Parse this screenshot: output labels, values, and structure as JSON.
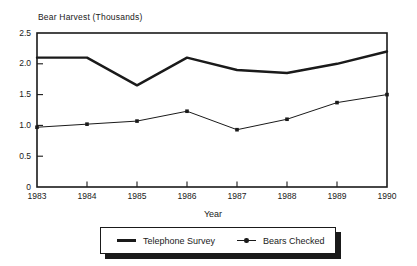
{
  "colors": {
    "ink": "#1a1a1a",
    "background": "#ffffff"
  },
  "chart_data": {
    "type": "line",
    "title": "Bear Harvest (Thousands)",
    "xlabel": "Year",
    "ylabel": "",
    "x": [
      1983,
      1984,
      1985,
      1986,
      1987,
      1988,
      1989,
      1990
    ],
    "ylim": [
      0,
      2.5
    ],
    "yticks": [
      0,
      0.5,
      1.0,
      1.5,
      2.0,
      2.5
    ],
    "ytick_labels": [
      "0",
      "0.5",
      "1.0",
      "1.5",
      "2.0",
      "2.5"
    ],
    "grid": false,
    "legend_position": "bottom",
    "series": [
      {
        "name": "Telephone Survey",
        "style": "thick-solid",
        "marker": "none",
        "values": [
          2.1,
          2.1,
          1.65,
          2.1,
          1.9,
          1.85,
          2.0,
          2.2
        ]
      },
      {
        "name": "Bears Checked",
        "style": "thin-solid",
        "marker": "square",
        "values": [
          0.97,
          1.02,
          1.07,
          1.23,
          0.93,
          1.1,
          1.37,
          1.5
        ]
      }
    ]
  }
}
